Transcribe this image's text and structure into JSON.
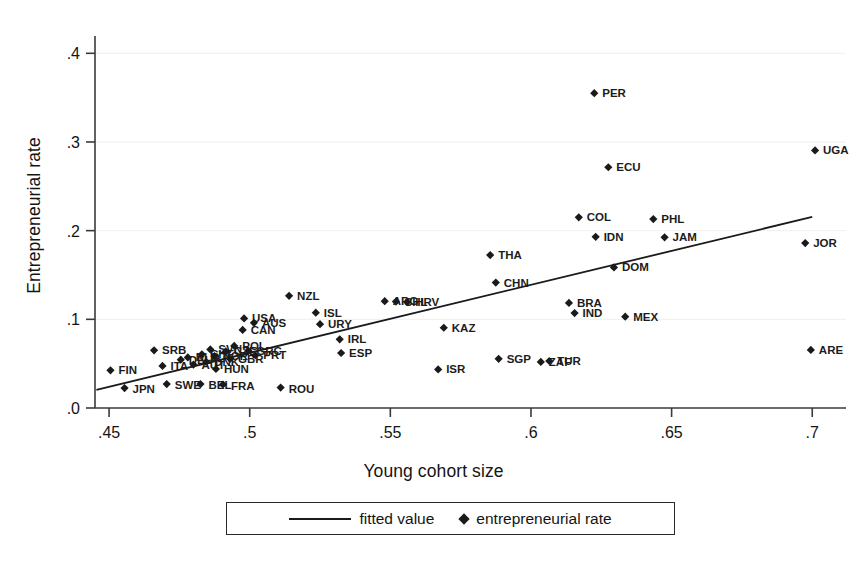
{
  "chart_data": {
    "type": "scatter",
    "title": "",
    "xlabel": "Young cohort size",
    "ylabel": "Entrepreneurial rate",
    "xlim": [
      0.445,
      0.712
    ],
    "ylim": [
      0.0,
      0.415
    ],
    "xticks": [
      ".45",
      ".5",
      ".55",
      ".6",
      ".65",
      ".7"
    ],
    "xtick_values": [
      0.45,
      0.5,
      0.55,
      0.6,
      0.65,
      0.7
    ],
    "yticks": [
      ".0",
      ".1",
      ".2",
      ".3",
      ".4"
    ],
    "ytick_values": [
      0.0,
      0.1,
      0.2,
      0.3,
      0.4
    ],
    "grid": false,
    "legend_position": "bottom-center",
    "legend": [
      {
        "marker": "line",
        "label": "fitted value"
      },
      {
        "marker": "diamond",
        "label": "entrepreneurial rate"
      }
    ],
    "fit_line": {
      "x0": 0.4455,
      "y0": 0.0205,
      "x1": 0.7,
      "y1": 0.2155
    },
    "points": [
      {
        "label": "FIN",
        "x": 0.4505,
        "y": 0.0425,
        "lx": 8,
        "ly": 4
      },
      {
        "label": "JPN",
        "x": 0.4555,
        "y": 0.0225,
        "lx": 8,
        "ly": 5
      },
      {
        "label": "SRB",
        "x": 0.466,
        "y": 0.065,
        "lx": 8,
        "ly": 4
      },
      {
        "label": "ITA",
        "x": 0.469,
        "y": 0.0475,
        "lx": 8,
        "ly": 4
      },
      {
        "label": "SWE",
        "x": 0.4705,
        "y": 0.027,
        "lx": 8,
        "ly": 5
      },
      {
        "label": "DEU",
        "x": 0.4755,
        "y": 0.0545,
        "lx": 8,
        "ly": 4
      },
      {
        "label": "NLD",
        "x": 0.478,
        "y": 0.057,
        "lx": 8,
        "ly": 4
      },
      {
        "label": "AUT",
        "x": 0.48,
        "y": 0.049,
        "lx": 8,
        "ly": 4
      },
      {
        "label": "BEL",
        "x": 0.4825,
        "y": 0.027,
        "lx": 8,
        "ly": 5
      },
      {
        "label": "CHE",
        "x": 0.483,
        "y": 0.0605,
        "lx": 8,
        "ly": 4
      },
      {
        "label": "DNK",
        "x": 0.4845,
        "y": 0.052,
        "lx": 8,
        "ly": 4
      },
      {
        "label": "SVN",
        "x": 0.486,
        "y": 0.066,
        "lx": 8,
        "ly": 4
      },
      {
        "label": "NOR",
        "x": 0.4875,
        "y": 0.0585,
        "lx": 8,
        "ly": 4
      },
      {
        "label": "HUN",
        "x": 0.488,
        "y": 0.044,
        "lx": 8,
        "ly": 4
      },
      {
        "label": "FRA",
        "x": 0.4905,
        "y": 0.0265,
        "lx": 8,
        "ly": 5
      },
      {
        "label": "CZE",
        "x": 0.4915,
        "y": 0.064,
        "lx": 8,
        "ly": 4
      },
      {
        "label": "GBR",
        "x": 0.493,
        "y": 0.0555,
        "lx": 8,
        "ly": 4
      },
      {
        "label": "POL",
        "x": 0.4945,
        "y": 0.07,
        "lx": 8,
        "ly": 4
      },
      {
        "label": "CAN",
        "x": 0.4975,
        "y": 0.088,
        "lx": 8,
        "ly": 4
      },
      {
        "label": "USA",
        "x": 0.498,
        "y": 0.101,
        "lx": 8,
        "ly": 4
      },
      {
        "label": "GRC",
        "x": 0.4995,
        "y": 0.0645,
        "lx": 8,
        "ly": 4
      },
      {
        "label": "AUS",
        "x": 0.5015,
        "y": 0.096,
        "lx": 8,
        "ly": 4
      },
      {
        "label": "PRT",
        "x": 0.502,
        "y": 0.0595,
        "lx": 8,
        "ly": 4
      },
      {
        "label": "ROU",
        "x": 0.511,
        "y": 0.023,
        "lx": 8,
        "ly": 5
      },
      {
        "label": "NZL",
        "x": 0.514,
        "y": 0.1265,
        "lx": 8,
        "ly": 4
      },
      {
        "label": "ISL",
        "x": 0.5235,
        "y": 0.1075,
        "lx": 8,
        "ly": 4
      },
      {
        "label": "URY",
        "x": 0.525,
        "y": 0.0945,
        "lx": 8,
        "ly": 4
      },
      {
        "label": "IRL",
        "x": 0.532,
        "y": 0.0775,
        "lx": 8,
        "ly": 4
      },
      {
        "label": "ESP",
        "x": 0.5325,
        "y": 0.062,
        "lx": 8,
        "ly": 4
      },
      {
        "label": "ARG",
        "x": 0.548,
        "y": 0.1205,
        "lx": 8,
        "ly": 4
      },
      {
        "label": "CHL",
        "x": 0.552,
        "y": 0.12,
        "lx": 8,
        "ly": 4
      },
      {
        "label": "HRV",
        "x": 0.556,
        "y": 0.1195,
        "lx": 8,
        "ly": 4
      },
      {
        "label": "ISR",
        "x": 0.567,
        "y": 0.0435,
        "lx": 8,
        "ly": 4
      },
      {
        "label": "KAZ",
        "x": 0.569,
        "y": 0.0905,
        "lx": 8,
        "ly": 4
      },
      {
        "label": "THA",
        "x": 0.5855,
        "y": 0.1725,
        "lx": 8,
        "ly": 4
      },
      {
        "label": "CHN",
        "x": 0.5875,
        "y": 0.1415,
        "lx": 8,
        "ly": 4
      },
      {
        "label": "SGP",
        "x": 0.5885,
        "y": 0.0555,
        "lx": 8,
        "ly": 4
      },
      {
        "label": "PER",
        "x": 0.6225,
        "y": 0.355,
        "lx": 8,
        "ly": 4
      },
      {
        "label": "ZAF",
        "x": 0.6035,
        "y": 0.052,
        "lx": 8,
        "ly": 4
      },
      {
        "label": "TUR",
        "x": 0.6065,
        "y": 0.053,
        "lx": 8,
        "ly": 4
      },
      {
        "label": "BRA",
        "x": 0.6135,
        "y": 0.1185,
        "lx": 8,
        "ly": 4
      },
      {
        "label": "IND",
        "x": 0.6155,
        "y": 0.107,
        "lx": 8,
        "ly": 4
      },
      {
        "label": "COL",
        "x": 0.617,
        "y": 0.215,
        "lx": 8,
        "ly": 4
      },
      {
        "label": "IDN",
        "x": 0.623,
        "y": 0.193,
        "lx": 8,
        "ly": 4
      },
      {
        "label": "ECU",
        "x": 0.6275,
        "y": 0.2715,
        "lx": 8,
        "ly": 4
      },
      {
        "label": "DOM",
        "x": 0.6295,
        "y": 0.1585,
        "lx": 8,
        "ly": 4
      },
      {
        "label": "MEX",
        "x": 0.6335,
        "y": 0.103,
        "lx": 8,
        "ly": 4
      },
      {
        "label": "PHL",
        "x": 0.6435,
        "y": 0.213,
        "lx": 8,
        "ly": 4
      },
      {
        "label": "JAM",
        "x": 0.6475,
        "y": 0.1925,
        "lx": 8,
        "ly": 4
      },
      {
        "label": "UGA",
        "x": 0.701,
        "y": 0.2905,
        "lx": 8,
        "ly": 4
      },
      {
        "label": "JOR",
        "x": 0.6975,
        "y": 0.186,
        "lx": 8,
        "ly": 4
      },
      {
        "label": "ARE",
        "x": 0.6995,
        "y": 0.0655,
        "lx": 8,
        "ly": 4
      }
    ]
  }
}
